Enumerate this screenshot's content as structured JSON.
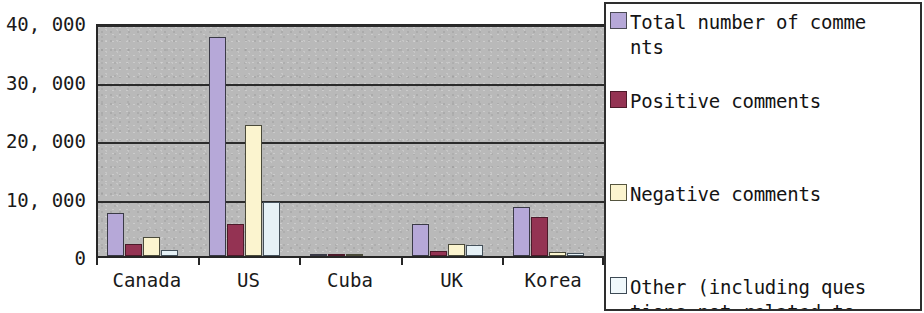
{
  "chart_data": {
    "type": "bar",
    "title": "",
    "xlabel": "",
    "ylabel": "",
    "ylim": [
      0,
      40000
    ],
    "grid": true,
    "legend_position": "right",
    "y_ticks": [
      "0",
      "10, 000",
      "20, 000",
      "30, 000",
      "40, 000"
    ],
    "y_tick_values": [
      0,
      10000,
      20000,
      30000,
      40000
    ],
    "categories": [
      "Canada",
      "US",
      "Cuba",
      "UK",
      "Korea"
    ],
    "series": [
      {
        "name": "Total number of comments",
        "legend_label": "Total number of comme\nnts",
        "color": "#b6a8d8",
        "values": [
          7300,
          37500,
          200,
          5500,
          8400
        ]
      },
      {
        "name": "Positive comments",
        "legend_label": "Positive comments",
        "color": "#943353",
        "values": [
          2000,
          5400,
          100,
          800,
          6600
        ]
      },
      {
        "name": "Negative comments",
        "legend_label": "Negative comments",
        "color": "#fbf4cf",
        "values": [
          3300,
          22400,
          100,
          2000,
          700
        ]
      },
      {
        "name": "Other (including questions not related to",
        "legend_label": "Other (including ques\ntions not related to",
        "color": "#f0f8fb",
        "values": [
          1100,
          9300,
          0,
          1800,
          500
        ]
      }
    ]
  },
  "legend": {
    "items": [
      {
        "label": "Total number of comme\nnts",
        "swatch": "#b6a8d8"
      },
      {
        "label": "Positive comments",
        "swatch": "#943353"
      },
      {
        "label": "Negative comments",
        "swatch": "#fbf4cf"
      },
      {
        "label": "Other (including ques\ntions not related to",
        "swatch": "#f0f8fb"
      }
    ]
  }
}
